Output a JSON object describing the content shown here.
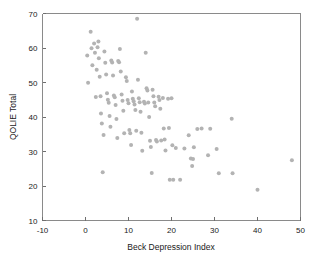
{
  "chart_data": {
    "type": "scatter",
    "title": "",
    "xlabel": "Beck Depression Index",
    "ylabel": "QOLIE Total",
    "xlim": [
      -10,
      50
    ],
    "ylim": [
      10,
      70
    ],
    "xticks": [
      -10,
      0,
      10,
      20,
      30,
      40,
      50
    ],
    "yticks": [
      10,
      20,
      30,
      40,
      50,
      60,
      70
    ],
    "xtick_labels": [
      "-10",
      "0",
      "10",
      "20",
      "30",
      "40",
      "50"
    ],
    "ytick_labels": [
      "10",
      "20",
      "30",
      "40",
      "50",
      "60",
      "70"
    ],
    "grid": false,
    "legend": null,
    "marker": {
      "shape": "circle",
      "color": "#b3b3b3",
      "size_px": 4
    },
    "series": [
      {
        "name": "Patients",
        "points": [
          [
            0.4,
            57.8
          ],
          [
            0.6,
            49.9
          ],
          [
            1.2,
            64.7
          ],
          [
            1.4,
            59.9
          ],
          [
            1.6,
            55.0
          ],
          [
            2.0,
            61.3
          ],
          [
            2.2,
            58.6
          ],
          [
            2.4,
            45.8
          ],
          [
            2.6,
            53.7
          ],
          [
            2.8,
            60.2
          ],
          [
            3.0,
            61.9
          ],
          [
            3.1,
            57.0
          ],
          [
            3.3,
            51.7
          ],
          [
            3.5,
            46.0
          ],
          [
            3.6,
            41.0
          ],
          [
            3.8,
            38.1
          ],
          [
            4.0,
            24.0
          ],
          [
            4.2,
            34.8
          ],
          [
            4.4,
            59.0
          ],
          [
            4.6,
            55.7
          ],
          [
            4.8,
            52.3
          ],
          [
            5.0,
            46.9
          ],
          [
            5.2,
            45.0
          ],
          [
            5.4,
            44.1
          ],
          [
            5.6,
            40.3
          ],
          [
            5.8,
            37.2
          ],
          [
            6.0,
            56.4
          ],
          [
            6.2,
            55.8
          ],
          [
            6.4,
            52.0
          ],
          [
            6.6,
            46.2
          ],
          [
            6.8,
            45.7
          ],
          [
            7.0,
            43.5
          ],
          [
            7.2,
            39.4
          ],
          [
            7.4,
            33.9
          ],
          [
            7.6,
            56.2
          ],
          [
            7.8,
            55.9
          ],
          [
            8.0,
            59.7
          ],
          [
            8.2,
            53.2
          ],
          [
            8.4,
            46.5
          ],
          [
            8.6,
            44.7
          ],
          [
            8.8,
            41.8
          ],
          [
            9.0,
            35.3
          ],
          [
            9.4,
            51.5
          ],
          [
            9.6,
            50.4
          ],
          [
            9.8,
            44.9
          ],
          [
            10.0,
            44.0
          ],
          [
            10.2,
            36.2
          ],
          [
            10.4,
            35.3
          ],
          [
            10.6,
            31.9
          ],
          [
            10.8,
            47.4
          ],
          [
            11.0,
            45.3
          ],
          [
            11.2,
            44.6
          ],
          [
            11.4,
            43.6
          ],
          [
            11.6,
            42.0
          ],
          [
            11.8,
            36.0
          ],
          [
            12.0,
            68.5
          ],
          [
            12.2,
            50.8
          ],
          [
            12.4,
            45.4
          ],
          [
            12.6,
            44.3
          ],
          [
            12.8,
            41.5
          ],
          [
            13.0,
            35.4
          ],
          [
            13.2,
            30.2
          ],
          [
            13.6,
            44.4
          ],
          [
            13.8,
            43.9
          ],
          [
            14.0,
            58.6
          ],
          [
            14.2,
            48.3
          ],
          [
            14.4,
            47.7
          ],
          [
            14.6,
            44.2
          ],
          [
            14.8,
            40.0
          ],
          [
            15.0,
            33.1
          ],
          [
            15.2,
            31.3
          ],
          [
            15.4,
            23.8
          ],
          [
            15.6,
            47.9
          ],
          [
            15.8,
            46.0
          ],
          [
            16.0,
            44.2
          ],
          [
            16.2,
            43.1
          ],
          [
            16.4,
            33.3
          ],
          [
            16.6,
            32.9
          ],
          [
            17.0,
            45.9
          ],
          [
            17.2,
            44.9
          ],
          [
            17.4,
            42.4
          ],
          [
            17.6,
            33.2
          ],
          [
            18.0,
            45.5
          ],
          [
            18.2,
            36.7
          ],
          [
            18.4,
            33.5
          ],
          [
            18.6,
            30.3
          ],
          [
            19.2,
            45.3
          ],
          [
            19.4,
            36.8
          ],
          [
            19.6,
            21.8
          ],
          [
            20.0,
            45.4
          ],
          [
            20.2,
            31.8
          ],
          [
            20.4,
            21.8
          ],
          [
            21.0,
            31.0
          ],
          [
            22.0,
            21.8
          ],
          [
            23.0,
            30.9
          ],
          [
            24.0,
            34.7
          ],
          [
            24.5,
            28.0
          ],
          [
            24.8,
            25.8
          ],
          [
            25.0,
            27.8
          ],
          [
            25.2,
            31.2
          ],
          [
            26.0,
            36.5
          ],
          [
            27.0,
            36.7
          ],
          [
            28.5,
            28.9
          ],
          [
            29.0,
            36.6
          ],
          [
            30.5,
            30.7
          ],
          [
            31.0,
            23.7
          ],
          [
            34.0,
            39.5
          ],
          [
            34.2,
            23.7
          ],
          [
            40.0,
            18.9
          ],
          [
            48.0,
            27.5
          ]
        ]
      }
    ]
  },
  "axes": {
    "x_axis_name": "x-axis",
    "y_axis_name": "y-axis"
  }
}
